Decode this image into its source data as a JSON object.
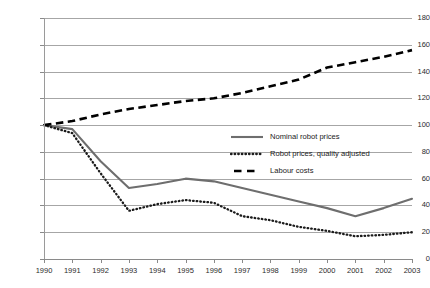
{
  "chart_data": {
    "type": "line",
    "title": "",
    "subtitle": "",
    "xlabel": "",
    "ylabel": "",
    "x": [
      1990,
      1991,
      1992,
      1993,
      1994,
      1995,
      1996,
      1997,
      1998,
      1999,
      2000,
      2001,
      2002,
      2003
    ],
    "categories": [
      "1990",
      "1991",
      "1992",
      "1993",
      "1994",
      "1995",
      "1996",
      "1997",
      "1998",
      "1999",
      "2000",
      "2001",
      "2002",
      "2003"
    ],
    "xlim": [
      1990,
      2003
    ],
    "ylim": [
      0,
      180
    ],
    "yticks": [
      0,
      20,
      40,
      60,
      80,
      100,
      120,
      140,
      160,
      180
    ],
    "ytick_labels": [
      "0",
      "20",
      "40",
      "60",
      "80",
      "100",
      "120",
      "140",
      "160",
      "180"
    ],
    "grid": "horizontal",
    "legend_position": "center-right",
    "series": [
      {
        "name": "Nominal  robot prices",
        "style": "solid",
        "color": "#6e6e6e",
        "values": [
          100,
          97,
          73,
          53,
          56,
          60,
          58,
          53,
          48,
          43,
          38,
          32,
          38,
          45
        ]
      },
      {
        "name": "Robot prices, quality adjusted",
        "style": "dotted",
        "color": "#1b1b1b",
        "values": [
          100,
          94,
          64,
          36,
          41,
          44,
          42,
          32,
          29,
          24,
          21,
          17,
          18,
          20
        ]
      },
      {
        "name": "Labour costs",
        "style": "dashed",
        "color": "#000000",
        "values": [
          100,
          103,
          108,
          112,
          115,
          118,
          120,
          124,
          129,
          134,
          143,
          147,
          151,
          156
        ]
      }
    ]
  },
  "legend": {
    "items": [
      {
        "label": "Nominal  robot prices",
        "icon": "solid-line-swatch"
      },
      {
        "label": "Robot prices, quality adjusted",
        "icon": "dotted-line-swatch"
      },
      {
        "label": "Labour costs",
        "icon": "dashed-line-swatch"
      }
    ]
  },
  "colors": {
    "gridline": "#a6a6a6",
    "axis": "#8a8a8a",
    "text": "#1a1a1a",
    "background": "#ffffff"
  }
}
